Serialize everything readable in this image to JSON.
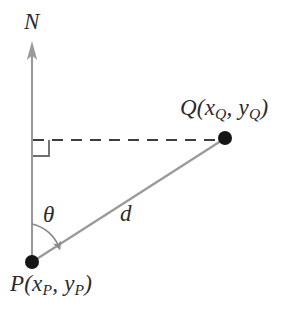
{
  "figure": {
    "type": "geometry-diagram",
    "background_color": "#ffffff"
  },
  "labels": {
    "north": "N",
    "theta": "θ",
    "distance": "d",
    "point_p": {
      "name": "P",
      "open_paren": "(",
      "x_var": "x",
      "x_sub": "P",
      "comma": ", ",
      "y_var": "y",
      "y_sub": "P",
      "close_paren": ")",
      "full": "P(xP, yP)"
    },
    "point_q": {
      "name": "Q",
      "open_paren": "(",
      "x_var": "x",
      "x_sub": "Q",
      "comma": ", ",
      "y_var": "y",
      "y_sub": "Q",
      "close_paren": ")",
      "full": "Q(xQ, yQ)"
    }
  },
  "geometry": {
    "point_p": {
      "x": 32,
      "y": 262
    },
    "point_q": {
      "x": 225,
      "y": 138
    },
    "north_axis": {
      "x": 32,
      "y_top": 42,
      "y_bottom": 262
    },
    "dashed_line": {
      "x1": 33,
      "y1": 140,
      "x2": 222,
      "y2": 140
    },
    "right_angle_marker": {
      "x": 33,
      "y": 140,
      "size": 16
    },
    "angle_arc": {
      "center_x": 32,
      "center_y": 262,
      "radius": 37,
      "start_deg": 0,
      "end_deg": 57
    },
    "dot_radius": 6.5
  },
  "colors": {
    "line_gray": "#9a9a9a",
    "dash_dark": "#3a3a3a",
    "dot_black": "#1a1a1a",
    "text": "#2b2b2b",
    "arc_gray": "#8a8a8a"
  }
}
